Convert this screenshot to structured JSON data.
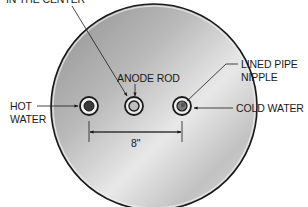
{
  "diagram": {
    "type": "water heater top view",
    "labels": {
      "top_cutoff": "IN THE CENTER",
      "anode_rod": "ANODE ROD",
      "lined_pipe_nipple_line1": "LINED PIPE",
      "lined_pipe_nipple_line2": "NIPPLE",
      "hot_water_line1": "HOT",
      "hot_water_line2": "WATER",
      "cold_water": "COLD WATER",
      "dimension": "8\""
    },
    "components": [
      {
        "name": "hot-water-fitting",
        "label": "HOT WATER"
      },
      {
        "name": "anode-rod",
        "label": "ANODE ROD"
      },
      {
        "name": "cold-water-fitting",
        "label": "COLD WATER / LINED PIPE NIPPLE"
      }
    ],
    "colors": {
      "disk_light": "#e6e6e6",
      "disk_mid": "#b4b4b4",
      "disk_dark": "#8c8c8c",
      "outline": "#1a1a1a",
      "text": "#1a1a1a"
    }
  }
}
